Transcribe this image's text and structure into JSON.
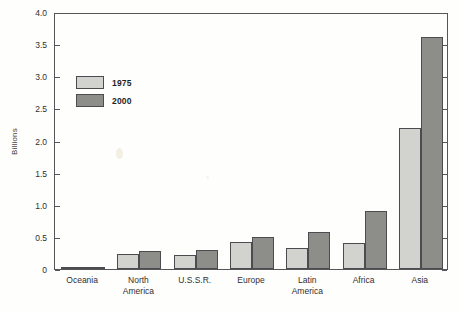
{
  "chart_data": {
    "type": "bar",
    "title": "",
    "xlabel": "",
    "ylabel": "Billions",
    "ylim": [
      0,
      4.0
    ],
    "ytick_values": [
      0,
      0.5,
      1.0,
      1.5,
      2.0,
      2.5,
      3.0,
      3.5,
      4.0
    ],
    "ytick_labels": [
      "0",
      "0.5",
      "1.0",
      "1.5",
      "2.0",
      "2.5",
      "3.0",
      "3.5",
      "4.0"
    ],
    "grid": false,
    "legend_position": "inside-upper-left",
    "categories": [
      "Oceania",
      "North\nAmerica",
      "U.S.S.R.",
      "Europe",
      "Latin\nAmerica",
      "Africa",
      "Asia"
    ],
    "series": [
      {
        "name": "1975",
        "color": "#d2d2ce",
        "values": [
          0.02,
          0.24,
          0.22,
          0.42,
          0.33,
          0.4,
          2.2
        ]
      },
      {
        "name": "2000",
        "color": "#8d8d8a",
        "values": [
          0.03,
          0.28,
          0.3,
          0.5,
          0.57,
          0.9,
          3.61
        ]
      }
    ]
  },
  "legend": {
    "items": [
      {
        "label": "1975"
      },
      {
        "label": "2000"
      }
    ]
  },
  "colors": {
    "bar_1975": "#d2d2ce",
    "bar_2000": "#8d8d8a",
    "axis": "#56565a",
    "text": "#2f2f2f",
    "background": "#fefefd"
  },
  "caption": {
    "text": ""
  }
}
